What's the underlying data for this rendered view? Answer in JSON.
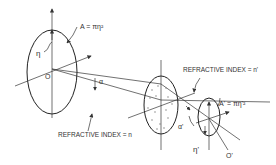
{
  "diagram": {
    "labels": {
      "area_object": "A = πη²",
      "area_image": "A' = πη'²",
      "eta": "η",
      "eta_prime": "η'",
      "origin": "O",
      "origin_prime": "O'",
      "alpha": "α",
      "alpha_prime": "α'",
      "refractive_index_object": "REFRACTIVE INDEX = n",
      "refractive_index_image": "REFRACTIVE INDEX = n'"
    },
    "elements": [
      {
        "id": "object-aperture",
        "shape": "ellipse",
        "label": "A = πη²"
      },
      {
        "id": "lens",
        "shape": "ellipse",
        "fill": "dotted"
      },
      {
        "id": "image-aperture",
        "shape": "ellipse",
        "label": "A' = πη'²"
      }
    ],
    "colors": {
      "stroke": "#222222",
      "background": "#ffffff"
    }
  }
}
